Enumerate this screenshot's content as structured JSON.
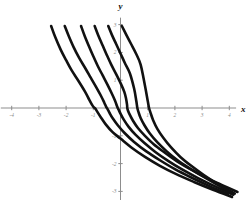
{
  "figure": {
    "background_color": "#ffffff",
    "curve_color": "#111111",
    "axis_color": "#8d8d8d",
    "label_color": "#8a8a8a",
    "axis_name_color": "#111111"
  },
  "chart_data": {
    "type": "line",
    "title": "",
    "subtitle": "",
    "xlabel": "x",
    "ylabel": "y",
    "xlim": [
      -4.4,
      4.4
    ],
    "ylim": [
      -3.4,
      3.4
    ],
    "grid": false,
    "legend": false,
    "legend_position": "none",
    "x_ticks": [
      -4,
      -3,
      -2,
      -1,
      1,
      2,
      3,
      4
    ],
    "x_tick_labels": [
      "-4",
      "-3",
      "-2",
      "-1",
      "1",
      "2",
      "3",
      "4"
    ],
    "y_ticks": [
      3,
      2,
      1,
      -1,
      -2,
      -3
    ],
    "y_tick_labels": [
      "3",
      "2",
      "1",
      "-1",
      "-2",
      "-3"
    ],
    "annotations": [],
    "series": [
      {
        "name": "curve-1",
        "shift": -0.95,
        "points_x": [
          -2.55,
          -2.4,
          -2.2,
          -2.0,
          -1.8,
          -1.55,
          -1.3,
          -1.15,
          -1.05,
          -0.98,
          -0.95,
          -0.92,
          -0.85,
          -0.72,
          -0.55,
          -0.3,
          0.0,
          0.4,
          0.9,
          1.45,
          2.05,
          2.7,
          3.4,
          4.1
        ],
        "points_y": [
          2.95,
          2.55,
          2.1,
          1.72,
          1.36,
          0.98,
          0.58,
          0.3,
          0.12,
          0.02,
          0.0,
          -0.03,
          -0.14,
          -0.34,
          -0.58,
          -0.86,
          -1.1,
          -1.42,
          -1.76,
          -2.08,
          -2.38,
          -2.66,
          -2.94,
          -3.2
        ]
      },
      {
        "name": "curve-2",
        "shift": -0.5,
        "points_x": [
          -2.05,
          -1.9,
          -1.72,
          -1.52,
          -1.3,
          -1.1,
          -0.9,
          -0.72,
          -0.6,
          -0.53,
          -0.5,
          -0.47,
          -0.4,
          -0.28,
          -0.1,
          0.15,
          0.5,
          0.95,
          1.45,
          2.0,
          2.6,
          3.25,
          3.95
        ],
        "points_y": [
          2.95,
          2.58,
          2.18,
          1.8,
          1.44,
          1.1,
          0.76,
          0.44,
          0.2,
          0.05,
          0.0,
          -0.05,
          -0.18,
          -0.38,
          -0.62,
          -0.9,
          -1.22,
          -1.56,
          -1.88,
          -2.2,
          -2.5,
          -2.8,
          -3.1
        ]
      },
      {
        "name": "curve-3",
        "shift": -0.1,
        "points_x": [
          -1.45,
          -1.32,
          -1.16,
          -1.0,
          -0.84,
          -0.66,
          -0.48,
          -0.32,
          -0.2,
          -0.13,
          -0.1,
          -0.07,
          0.0,
          0.12,
          0.3,
          0.55,
          0.88,
          1.28,
          1.75,
          2.28,
          2.85,
          3.48,
          4.15
        ],
        "points_y": [
          2.95,
          2.6,
          2.22,
          1.86,
          1.52,
          1.18,
          0.84,
          0.52,
          0.26,
          0.07,
          0.0,
          -0.06,
          -0.2,
          -0.42,
          -0.68,
          -0.96,
          -1.26,
          -1.58,
          -1.9,
          -2.22,
          -2.52,
          -2.82,
          -3.12
        ]
      },
      {
        "name": "curve-4",
        "shift": 0.25,
        "points_x": [
          -0.95,
          -0.82,
          -0.66,
          -0.5,
          -0.34,
          -0.16,
          0.02,
          0.14,
          0.2,
          0.24,
          0.25,
          0.27,
          0.34,
          0.46,
          0.64,
          0.9,
          1.22,
          1.62,
          2.08,
          2.6,
          3.18,
          3.8,
          4.3
        ],
        "points_y": [
          2.95,
          2.62,
          2.26,
          1.9,
          1.56,
          1.22,
          0.86,
          0.58,
          0.36,
          0.12,
          0.0,
          -0.08,
          -0.24,
          -0.46,
          -0.72,
          -1.0,
          -1.3,
          -1.6,
          -1.92,
          -2.22,
          -2.52,
          -2.8,
          -3.02
        ]
      },
      {
        "name": "curve-5",
        "shift": 0.62,
        "points_x": [
          -0.45,
          -0.32,
          -0.16,
          0.0,
          0.16,
          0.34,
          0.5,
          0.58,
          0.62,
          0.66,
          0.74,
          0.88,
          1.08,
          1.36,
          1.7,
          2.1,
          2.56,
          3.06,
          3.6,
          4.2
        ],
        "points_y": [
          2.95,
          2.64,
          2.3,
          1.96,
          1.62,
          1.26,
          0.7,
          0.26,
          0.0,
          -0.14,
          -0.36,
          -0.62,
          -0.92,
          -1.24,
          -1.56,
          -1.88,
          -2.18,
          -2.48,
          -2.78,
          -3.08
        ]
      },
      {
        "name": "curve-6",
        "shift": 1.05,
        "points_x": [
          0.05,
          0.2,
          0.38,
          0.56,
          0.74,
          0.9,
          1.0,
          1.05,
          1.1,
          1.2,
          1.36,
          1.58,
          1.86,
          2.2,
          2.6,
          3.05,
          3.55,
          4.1
        ],
        "points_y": [
          2.95,
          2.66,
          2.32,
          1.98,
          1.56,
          0.8,
          0.26,
          0.0,
          -0.16,
          -0.44,
          -0.76,
          -1.08,
          -1.42,
          -1.76,
          -2.08,
          -2.4,
          -2.72,
          -3.04
        ]
      }
    ]
  }
}
